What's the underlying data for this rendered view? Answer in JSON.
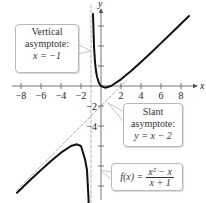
{
  "chart_data": {
    "type": "line",
    "title": "",
    "function": "f(x) = (x^2 - x)/(x + 1)",
    "xlabel": "x",
    "ylabel": "y",
    "xlim": [
      -10,
      9.6
    ],
    "ylim": [
      -11.7,
      8.1
    ],
    "x_ticks": [
      -8,
      -6,
      -4,
      -2,
      2,
      4,
      6,
      8
    ],
    "x_tick_labels": [
      "−8",
      "−6",
      "−4",
      "−2",
      "2",
      "4",
      "6",
      "8"
    ],
    "y_ticks": [
      -10,
      -8,
      -6,
      -4,
      -2,
      2,
      4,
      6
    ],
    "y_tick_labels_shown": [
      "−2",
      "−4"
    ],
    "grid": false,
    "series": [
      {
        "name": "f(x) right branch",
        "style": "solid",
        "color": "#111111",
        "x": [
          -0.8,
          -0.7,
          -0.6,
          -0.5,
          -0.4,
          -0.2,
          0,
          0.414,
          1,
          2,
          3,
          4,
          5,
          6,
          7,
          8,
          8.8
        ],
        "y": [
          7.2,
          3.97,
          2.4,
          1.5,
          0.93,
          0.3,
          0,
          -0.17,
          0,
          0.67,
          1.5,
          2.4,
          3.33,
          4.29,
          5.25,
          6.22,
          7.0
        ]
      },
      {
        "name": "f(x) left branch",
        "style": "solid",
        "color": "#111111",
        "x": [
          -8.4,
          -7,
          -6,
          -5,
          -4,
          -3,
          -2.414,
          -2,
          -1.6,
          -1.4,
          -1.25,
          -1.18
        ],
        "y": [
          -10.67,
          -9.33,
          -8.4,
          -7.5,
          -6.67,
          -6,
          -5.83,
          -6,
          -7.33,
          -8.4,
          -11.25,
          -14.3
        ]
      },
      {
        "name": "Slant asymptote y = x - 2",
        "style": "dashed",
        "color": "#aaaaaa",
        "x": [
          -8.4,
          2.6
        ],
        "y": [
          -10.4,
          0.6
        ]
      },
      {
        "name": "Vertical asymptote x = -1",
        "style": "dashed",
        "color": "#aaaaaa",
        "x": [
          -1,
          -1
        ],
        "y": [
          8.1,
          -11.7
        ]
      }
    ],
    "annotations": [
      {
        "text": "Vertical asymptote: x = −1",
        "points_to": [
          -1,
          3.5
        ]
      },
      {
        "text": "Slant asymptote: y = x − 2",
        "points_to": [
          0.7,
          -1.7
        ]
      },
      {
        "text": "f(x) = (x² − x)/(x + 1)",
        "points_to": [
          -0.1,
          -8.4
        ]
      }
    ]
  },
  "axes": {
    "x_label": "x",
    "y_label": "y",
    "x_tick_labels": [
      "−8",
      "−6",
      "−4",
      "−2",
      "2",
      "4",
      "6",
      "8"
    ],
    "y_tick_labels": [
      "−2",
      "−4"
    ]
  },
  "callouts": {
    "vertical": {
      "line1": "Vertical",
      "line2": "asymptote:",
      "line3": "x = −1"
    },
    "slant": {
      "line1": "Slant",
      "line2": "asymptote:",
      "line3": "y = x − 2"
    },
    "function": {
      "lhs": "f(x) =",
      "numerator": "x² − x",
      "denominator": "x + 1"
    }
  }
}
